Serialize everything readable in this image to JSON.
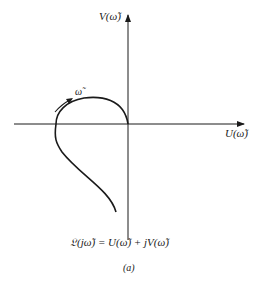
{
  "figure": {
    "v_axis_label": "V(ω̃)",
    "u_axis_label": "U(ω̃)",
    "omega_label": "ω̃",
    "equation": "𝔏(jω̃) = U(ω̃) + jV(ω̃)",
    "caption": "(a)"
  },
  "colors": {
    "ink": "#1a1a1a",
    "background": "#ffffff"
  }
}
